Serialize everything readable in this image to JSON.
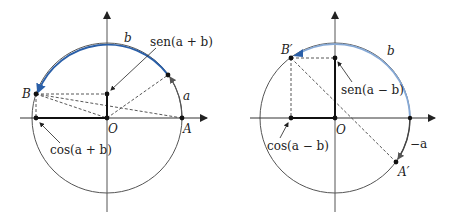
{
  "colors": {
    "axis": "#333333",
    "circle": "#555555",
    "arc_left": "#2a5fa8",
    "arc_right": "#86a9d6",
    "arrowhead_right": "#2a5fa8",
    "dashed": "#444444",
    "segment": "#111111"
  },
  "left": {
    "labels": {
      "b": "b",
      "a": "a",
      "B": "B",
      "O": "O",
      "A": "A",
      "sen": "sen(a + b)",
      "cos": "cos(a + b)"
    }
  },
  "right": {
    "labels": {
      "b": "b",
      "minus_a": "−a",
      "B_prime": "B′",
      "O": "O",
      "A_prime": "A′",
      "sen": "sen(a − b)",
      "cos": "cos(a − b)"
    }
  }
}
